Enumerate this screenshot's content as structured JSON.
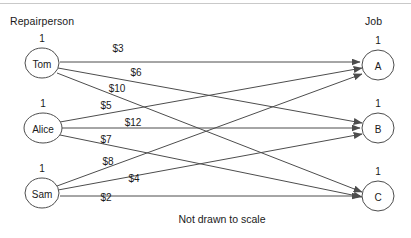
{
  "figure": {
    "footnote": "Not drawn to scale",
    "left_heading": "Repairperson",
    "right_heading": "Job",
    "stroke_color": "#4d4d4d",
    "text_color": "#1a1a1a",
    "background_color": "#ffffff",
    "top_rule_color": "#c9c9c9"
  },
  "chart_data": {
    "type": "diagram",
    "title": "Not drawn to scale",
    "subtype": "bipartite-assignment-network",
    "xlabel": "",
    "ylabel": "",
    "left_heading": "Repairperson",
    "right_heading": "Job",
    "legend": [],
    "grid": false,
    "supply_nodes": [
      {
        "id": "tom",
        "label": "Tom",
        "supply": "1",
        "cx": 42,
        "cy": 63,
        "rx": 17,
        "ry": 15
      },
      {
        "id": "alice",
        "label": "Alice",
        "supply": "1",
        "cx": 43,
        "cy": 128,
        "rx": 19,
        "ry": 15
      },
      {
        "id": "sam",
        "label": "Sam",
        "supply": "1",
        "cx": 42,
        "cy": 193,
        "rx": 17,
        "ry": 15
      }
    ],
    "demand_nodes": [
      {
        "id": "a",
        "label": "A",
        "demand": "1",
        "cx": 378,
        "cy": 65,
        "rx": 16,
        "ry": 15
      },
      {
        "id": "b",
        "label": "B",
        "demand": "1",
        "cx": 378,
        "cy": 128,
        "rx": 16,
        "ry": 15
      },
      {
        "id": "c",
        "label": "C",
        "demand": "1",
        "cx": 378,
        "cy": 196,
        "rx": 16,
        "ry": 15
      }
    ],
    "edges": [
      {
        "from": "tom",
        "to": "a",
        "cost": "$3",
        "value": 3,
        "label_x": 118,
        "label_y": 48,
        "x1": 60,
        "y1": 62,
        "x2": 360,
        "y2": 62
      },
      {
        "from": "tom",
        "to": "b",
        "cost": "$6",
        "value": 6,
        "label_x": 136,
        "label_y": 72,
        "x1": 58,
        "y1": 68,
        "x2": 362,
        "y2": 123
      },
      {
        "from": "tom",
        "to": "c",
        "cost": "$10",
        "value": 10,
        "label_x": 117,
        "label_y": 88,
        "x1": 57,
        "y1": 73,
        "x2": 362,
        "y2": 192
      },
      {
        "from": "alice",
        "to": "a",
        "cost": "$5",
        "value": 5,
        "label_x": 106,
        "label_y": 105,
        "x1": 60,
        "y1": 122,
        "x2": 362,
        "y2": 68
      },
      {
        "from": "alice",
        "to": "b",
        "cost": "$12",
        "value": 12,
        "label_x": 133,
        "label_y": 122,
        "x1": 62,
        "y1": 128,
        "x2": 360,
        "y2": 128
      },
      {
        "from": "alice",
        "to": "c",
        "cost": "$7",
        "value": 7,
        "label_x": 106,
        "label_y": 139,
        "x1": 60,
        "y1": 135,
        "x2": 362,
        "y2": 197
      },
      {
        "from": "sam",
        "to": "a",
        "cost": "$8",
        "value": 8,
        "label_x": 108,
        "label_y": 161,
        "x1": 57,
        "y1": 186,
        "x2": 362,
        "y2": 74
      },
      {
        "from": "sam",
        "to": "b",
        "cost": "$4",
        "value": 4,
        "label_x": 134,
        "label_y": 178,
        "x1": 58,
        "y1": 190,
        "x2": 362,
        "y2": 134
      },
      {
        "from": "sam",
        "to": "c",
        "cost": "$2",
        "value": 2,
        "label_x": 106,
        "label_y": 197,
        "x1": 60,
        "y1": 196,
        "x2": 360,
        "y2": 196
      }
    ],
    "cost_matrix": {
      "rows": [
        "Tom",
        "Alice",
        "Sam"
      ],
      "columns": [
        "A",
        "B",
        "C"
      ],
      "values": [
        [
          3,
          6,
          10
        ],
        [
          5,
          12,
          7
        ],
        [
          8,
          4,
          2
        ]
      ],
      "unit": "$"
    }
  }
}
